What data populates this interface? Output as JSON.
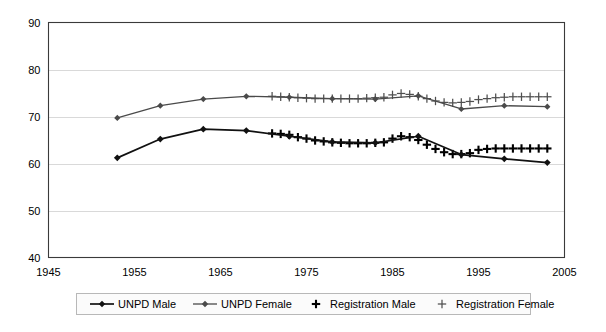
{
  "chart_data": {
    "type": "line",
    "title": "",
    "subtitle": "",
    "xlabel": "",
    "ylabel": "",
    "xlim": [
      1945,
      2005
    ],
    "ylim": [
      40,
      90
    ],
    "xticks": [
      1945,
      1955,
      1965,
      1975,
      1985,
      1995,
      2005
    ],
    "yticks": [
      40,
      50,
      60,
      70,
      80,
      90
    ],
    "grid": "horizontal",
    "legend_position": "bottom",
    "series": [
      {
        "name": "UNPD Male",
        "marker": "filled-diamond",
        "style": "line-with-markers",
        "color": "#111111",
        "x": [
          1953,
          1958,
          1963,
          1968,
          1973,
          1978,
          1983,
          1988,
          1993,
          1998,
          2003
        ],
        "values": [
          61.2,
          65.2,
          67.3,
          67.0,
          65.8,
          64.6,
          64.4,
          65.8,
          61.9,
          61.0,
          60.2
        ]
      },
      {
        "name": "UNPD Female",
        "marker": "filled-diamond",
        "style": "line-with-markers",
        "color": "#4a4a4a",
        "x": [
          1953,
          1958,
          1963,
          1968,
          1973,
          1978,
          1983,
          1988,
          1993,
          1998,
          2003
        ],
        "values": [
          69.7,
          72.3,
          73.7,
          74.3,
          74.1,
          73.8,
          73.7,
          74.4,
          71.6,
          72.3,
          72.1
        ]
      },
      {
        "name": "Registration Male",
        "marker": "plus-bold",
        "style": "markers-only",
        "color": "#000000",
        "x": [
          1971,
          1972,
          1973,
          1974,
          1975,
          1976,
          1977,
          1978,
          1979,
          1980,
          1981,
          1982,
          1983,
          1984,
          1985,
          1986,
          1987,
          1988,
          1989,
          1990,
          1991,
          1992,
          1993,
          1994,
          1995,
          1996,
          1997,
          1998,
          1999,
          2000,
          2001,
          2002,
          2003
        ],
        "values": [
          66.4,
          66.3,
          66.1,
          65.6,
          65.3,
          64.9,
          64.7,
          64.5,
          64.4,
          64.3,
          64.3,
          64.3,
          64.4,
          64.5,
          65.3,
          65.8,
          65.6,
          65.0,
          64.0,
          63.1,
          62.4,
          62.0,
          62.0,
          62.2,
          62.9,
          63.1,
          63.2,
          63.2,
          63.2,
          63.2,
          63.2,
          63.2,
          63.2
        ]
      },
      {
        "name": "Registration Female",
        "marker": "plus-light",
        "style": "markers-only",
        "color": "#4f4f4f",
        "x": [
          1971,
          1972,
          1973,
          1974,
          1975,
          1976,
          1977,
          1978,
          1979,
          1980,
          1981,
          1982,
          1983,
          1984,
          1985,
          1986,
          1987,
          1988,
          1989,
          1990,
          1991,
          1992,
          1993,
          1994,
          1995,
          1996,
          1997,
          1998,
          1999,
          2000,
          2001,
          2002,
          2003
        ],
        "values": [
          74.3,
          74.2,
          74.1,
          74.0,
          73.9,
          73.8,
          73.8,
          73.8,
          73.8,
          73.8,
          73.8,
          73.9,
          74.0,
          74.1,
          74.6,
          74.9,
          74.7,
          74.3,
          73.8,
          73.3,
          73.0,
          72.9,
          73.0,
          73.2,
          73.6,
          73.8,
          74.0,
          74.1,
          74.2,
          74.2,
          74.2,
          74.2,
          74.2
        ]
      }
    ]
  },
  "legend": {
    "items": [
      {
        "label": "UNPD Male",
        "type": "line-marker",
        "color": "#111111"
      },
      {
        "label": "UNPD Female",
        "type": "line-marker",
        "color": "#4a4a4a"
      },
      {
        "label": "Registration Male",
        "type": "plus-bold",
        "color": "#000000"
      },
      {
        "label": "Registration Female",
        "type": "plus-light",
        "color": "#4f4f4f"
      }
    ]
  },
  "axes": {
    "x_tick_labels": [
      "1945",
      "1955",
      "1965",
      "1975",
      "1985",
      "1995",
      "2005"
    ],
    "y_tick_labels": [
      "40",
      "50",
      "60",
      "70",
      "80",
      "90"
    ]
  },
  "colors": {
    "background": "#ffffff",
    "gridline": "#d9d9d9",
    "border": "#3a3a3a"
  }
}
